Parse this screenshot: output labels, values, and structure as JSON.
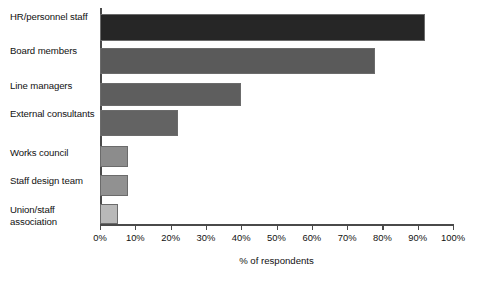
{
  "chart_data": {
    "type": "bar",
    "orientation": "horizontal",
    "title": "",
    "xlabel": "% of respondents",
    "ylabel": "",
    "xlim": [
      0,
      100
    ],
    "grid": false,
    "legend": "none",
    "categories": [
      "HR/personnel staff",
      "Board members",
      "Line managers",
      "External consultants",
      "Works council",
      "Staff design team",
      "Union/staff association"
    ],
    "values": [
      92,
      78,
      40,
      22,
      8,
      8,
      5
    ],
    "bar_colors": [
      "#262626",
      "#5a5a5a",
      "#5e5e5e",
      "#636363",
      "#8c8c8c",
      "#919191",
      "#b9b9b9"
    ],
    "xticks": [
      0,
      10,
      20,
      30,
      40,
      50,
      60,
      70,
      80,
      90,
      100
    ],
    "xtick_labels": [
      "0%",
      "10%",
      "20%",
      "30%",
      "40%",
      "50%",
      "60%",
      "70%",
      "80%",
      "90%",
      "100%"
    ]
  }
}
